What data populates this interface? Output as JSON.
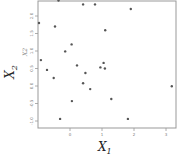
{
  "chart_data": {
    "type": "scatter",
    "title": "",
    "xlabel": "X1",
    "ylabel": "X2",
    "xlabel_main": "X",
    "xlabel_sub": "1",
    "ylabel_main": "X",
    "ylabel_sub": "2",
    "ylabel_inner": "X2",
    "xlim": [
      -1.0,
      3.3
    ],
    "ylim": [
      -1.2,
      2.4
    ],
    "x_ticks": [
      0,
      1,
      2,
      3
    ],
    "x_tick_labels": [
      "0",
      "1",
      "2",
      "3"
    ],
    "y_ticks": [
      2.0,
      1.5,
      1.0,
      0.5,
      0.0,
      -0.5,
      -1.0
    ],
    "y_tick_labels": [
      "2.0",
      "1.5",
      "1.0",
      "0.5",
      "0.0",
      "-0.5",
      "-1.0"
    ],
    "grid": false,
    "legend": null,
    "marker_color": "#555555",
    "points": [
      {
        "x": -0.36,
        "y": 2.44
      },
      {
        "x": -0.97,
        "y": 1.8
      },
      {
        "x": 0.41,
        "y": 2.33
      },
      {
        "x": 0.78,
        "y": 2.33
      },
      {
        "x": 1.9,
        "y": 2.2
      },
      {
        "x": -0.47,
        "y": 1.7
      },
      {
        "x": 1.1,
        "y": 1.59
      },
      {
        "x": 0.05,
        "y": 1.19
      },
      {
        "x": -0.15,
        "y": 0.99
      },
      {
        "x": -0.91,
        "y": 0.74
      },
      {
        "x": 1.05,
        "y": 0.66
      },
      {
        "x": 0.22,
        "y": 0.59
      },
      {
        "x": 0.95,
        "y": 0.53
      },
      {
        "x": -0.72,
        "y": 0.46
      },
      {
        "x": 1.09,
        "y": 0.5
      },
      {
        "x": 0.48,
        "y": 0.37
      },
      {
        "x": -0.51,
        "y": 0.23
      },
      {
        "x": 0.41,
        "y": 0.08
      },
      {
        "x": 0.63,
        "y": -0.09
      },
      {
        "x": 0.06,
        "y": -0.43
      },
      {
        "x": 1.29,
        "y": -0.37
      },
      {
        "x": 3.18,
        "y": -0.01
      },
      {
        "x": -0.31,
        "y": -0.94
      },
      {
        "x": 1.81,
        "y": -0.94
      }
    ]
  }
}
